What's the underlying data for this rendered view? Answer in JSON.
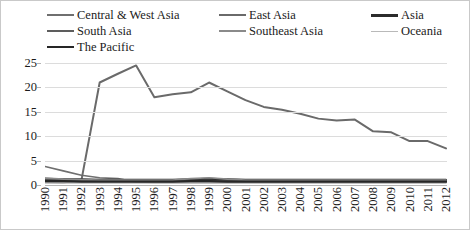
{
  "legend": {
    "items": [
      {
        "label": "Central & West Asia",
        "color": "#6f6f6f",
        "width": 2.0,
        "col": 0
      },
      {
        "label": "East Asia",
        "color": "#6a6a6a",
        "width": 2.0,
        "col": 1
      },
      {
        "label": "Asia",
        "color": "#2b2b2b",
        "width": 3.2,
        "col": 2
      },
      {
        "label": "South Asia",
        "color": "#5d5d5d",
        "width": 2.0,
        "col": 0
      },
      {
        "label": "Southeast Asia",
        "color": "#8a8a8a",
        "width": 2.0,
        "col": 1
      },
      {
        "label": "Oceania",
        "color": "#b9b9b9",
        "width": 1.6,
        "col": 2
      },
      {
        "label": "The Pacific",
        "color": "#262626",
        "width": 2.4,
        "col": 0
      }
    ]
  },
  "chart_data": {
    "type": "line",
    "title": "",
    "xlabel": "",
    "ylabel": "",
    "ylim": [
      0,
      25
    ],
    "yticks": [
      0,
      5,
      10,
      15,
      20,
      25
    ],
    "grid": true,
    "legend_position": "top",
    "x": [
      1990,
      1991,
      1992,
      1993,
      1994,
      1995,
      1996,
      1997,
      1998,
      1999,
      2000,
      2001,
      2002,
      2003,
      2004,
      2005,
      2006,
      2007,
      2008,
      2009,
      2010,
      2011,
      2012
    ],
    "categories": [
      "1990",
      "1991",
      "1992",
      "1993",
      "1994",
      "1995",
      "1996",
      "1997",
      "1998",
      "1999",
      "2000",
      "2001",
      "2002",
      "2003",
      "2004",
      "2005",
      "2006",
      "2007",
      "2008",
      "2009",
      "2010",
      "2011",
      "2012"
    ],
    "series": [
      {
        "name": "Central & West Asia",
        "color": "#6f6f6f",
        "width": 1.6,
        "values": [
          3.8,
          2.9,
          2.0,
          1.5,
          1.3,
          0.6,
          0.5,
          0.5,
          0.5,
          0.5,
          0.5,
          0.5,
          0.5,
          0.5,
          0.5,
          0.5,
          0.5,
          0.5,
          0.5,
          0.5,
          0.5,
          0.5,
          0.5
        ]
      },
      {
        "name": "East Asia",
        "color": "#6a6a6a",
        "width": 2.0,
        "values": [
          0.6,
          0.5,
          1.0,
          21.0,
          22.8,
          24.5,
          18.0,
          18.6,
          19.0,
          21.0,
          19.2,
          17.4,
          16.0,
          15.4,
          14.6,
          13.6,
          13.2,
          13.4,
          11.0,
          10.8,
          9.0,
          9.0,
          7.5
        ]
      },
      {
        "name": "Asia",
        "color": "#2b2b2b",
        "width": 2.6,
        "values": [
          1.2,
          1.1,
          1.1,
          1.0,
          1.0,
          1.0,
          1.0,
          1.0,
          1.1,
          1.2,
          1.1,
          1.0,
          1.0,
          1.0,
          1.0,
          1.0,
          1.0,
          1.0,
          1.0,
          1.0,
          1.0,
          1.0,
          1.0
        ]
      },
      {
        "name": "South Asia",
        "color": "#5d5d5d",
        "width": 1.6,
        "values": [
          1.0,
          0.9,
          0.9,
          0.8,
          0.8,
          0.8,
          0.8,
          0.8,
          0.9,
          0.9,
          0.8,
          0.8,
          0.8,
          0.8,
          0.8,
          0.8,
          0.8,
          0.8,
          0.8,
          0.8,
          0.8,
          0.8,
          0.8
        ]
      },
      {
        "name": "Southeast Asia",
        "color": "#8a8a8a",
        "width": 1.6,
        "values": [
          1.4,
          1.2,
          1.1,
          1.0,
          1.0,
          1.0,
          1.0,
          1.0,
          1.3,
          1.5,
          1.2,
          1.0,
          1.0,
          1.0,
          1.0,
          1.0,
          1.0,
          1.0,
          1.0,
          1.0,
          1.0,
          1.0,
          1.0
        ]
      },
      {
        "name": "Oceania",
        "color": "#b9b9b9",
        "width": 1.4,
        "values": [
          0.4,
          0.4,
          0.4,
          0.4,
          0.4,
          0.4,
          0.4,
          0.4,
          0.4,
          0.4,
          0.4,
          0.4,
          0.4,
          0.4,
          0.4,
          0.4,
          0.4,
          0.4,
          0.4,
          0.4,
          0.4,
          0.4,
          0.4
        ]
      },
      {
        "name": "The Pacific",
        "color": "#262626",
        "width": 2.2,
        "values": [
          0.8,
          0.8,
          0.7,
          0.7,
          0.7,
          0.7,
          0.7,
          0.7,
          0.8,
          0.8,
          0.7,
          0.7,
          0.7,
          0.7,
          0.7,
          0.7,
          0.7,
          0.7,
          0.7,
          0.7,
          0.7,
          0.7,
          0.7
        ]
      }
    ]
  }
}
